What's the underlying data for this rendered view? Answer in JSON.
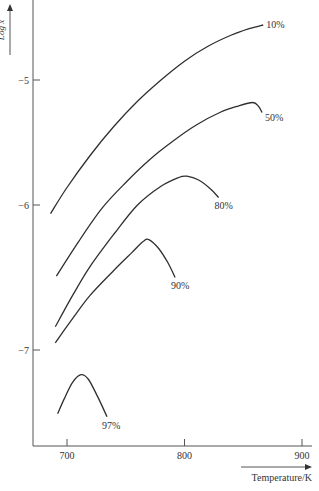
{
  "chart_data": {
    "type": "line",
    "title": "",
    "xlabel": "Temperature/K",
    "ylabel": "Log x",
    "xlim": [
      672,
      912
    ],
    "ylim": [
      -7.7,
      -4.4
    ],
    "x_ticks": [
      700,
      800,
      900
    ],
    "x_tick_labels": [
      "700",
      "800",
      "900"
    ],
    "y_ticks": [
      -5,
      -6,
      -7
    ],
    "y_tick_labels": [
      "−5",
      "−6",
      "−7"
    ],
    "grid": false,
    "legend": "inline labels at curve ends",
    "series": [
      {
        "name": "10%",
        "label": "10%",
        "points": [
          [
            686,
            -6.06
          ],
          [
            700,
            -5.86
          ],
          [
            720,
            -5.6
          ],
          [
            740,
            -5.37
          ],
          [
            760,
            -5.17
          ],
          [
            780,
            -5.0
          ],
          [
            800,
            -4.85
          ],
          [
            820,
            -4.73
          ],
          [
            840,
            -4.64
          ],
          [
            855,
            -4.59
          ],
          [
            867,
            -4.56
          ]
        ]
      },
      {
        "name": "50%",
        "label": "50%",
        "points": [
          [
            691,
            -6.49
          ],
          [
            710,
            -6.25
          ],
          [
            730,
            -6.02
          ],
          [
            750,
            -5.82
          ],
          [
            770,
            -5.64
          ],
          [
            790,
            -5.49
          ],
          [
            810,
            -5.36
          ],
          [
            830,
            -5.26
          ],
          [
            845,
            -5.21
          ],
          [
            858,
            -5.18
          ],
          [
            863,
            -5.21
          ],
          [
            866,
            -5.26
          ]
        ]
      },
      {
        "name": "80%",
        "label": "80%",
        "points": [
          [
            690,
            -6.84
          ],
          [
            705,
            -6.62
          ],
          [
            720,
            -6.42
          ],
          [
            740,
            -6.2
          ],
          [
            760,
            -6.0
          ],
          [
            780,
            -5.85
          ],
          [
            795,
            -5.78
          ],
          [
            802,
            -5.77
          ],
          [
            812,
            -5.8
          ],
          [
            822,
            -5.87
          ],
          [
            829,
            -5.94
          ]
        ]
      },
      {
        "name": "90%",
        "label": "90%",
        "points": [
          [
            690,
            -6.95
          ],
          [
            705,
            -6.78
          ],
          [
            720,
            -6.62
          ],
          [
            740,
            -6.45
          ],
          [
            755,
            -6.33
          ],
          [
            765,
            -6.25
          ],
          [
            770,
            -6.24
          ],
          [
            778,
            -6.3
          ],
          [
            786,
            -6.4
          ],
          [
            792,
            -6.5
          ]
        ]
      },
      {
        "name": "97%",
        "label": "97%",
        "points": [
          [
            692,
            -7.44
          ],
          [
            698,
            -7.33
          ],
          [
            705,
            -7.22
          ],
          [
            712,
            -7.17
          ],
          [
            718,
            -7.2
          ],
          [
            726,
            -7.32
          ],
          [
            734,
            -7.46
          ]
        ]
      }
    ]
  },
  "axes": {
    "x_label": "Temperature/K",
    "y_label": "Log x"
  }
}
